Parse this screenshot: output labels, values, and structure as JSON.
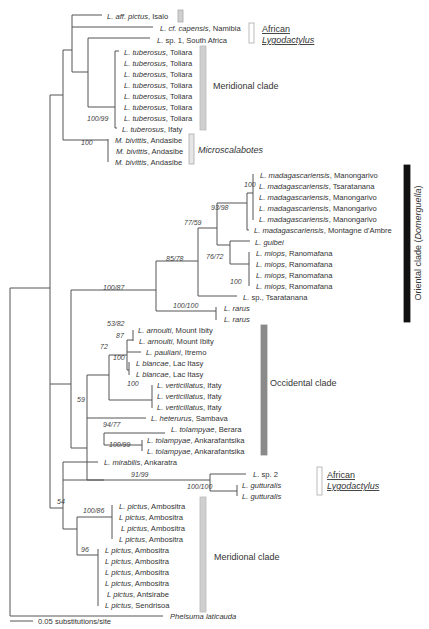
{
  "figure": {
    "type": "phylogenetic-tree",
    "scale_bar": {
      "label": "0.05 substitutions/site",
      "x1": 10,
      "x2": 33,
      "y": 621
    },
    "colors": {
      "line": "#555555",
      "grey_bar": "#d3d3d3",
      "dark_grey_bar": "#8a8a8a",
      "black_bar": "#111111"
    }
  },
  "taxa": [
    {
      "y": 16,
      "x": 104,
      "genus": "L. aff. pictus",
      "loc": ", Isalo"
    },
    {
      "y": 28,
      "x": 157,
      "genus": "L. cf. capensis",
      "loc": ", Namibia"
    },
    {
      "y": 40,
      "x": 154,
      "genus": "L.",
      "loc": " sp. 1, South Africa"
    },
    {
      "y": 52,
      "x": 121,
      "genus": "L. tuberosus",
      "loc": ", Toliara"
    },
    {
      "y": 63,
      "x": 121,
      "genus": "L. tuberosus",
      "loc": ", Toliara"
    },
    {
      "y": 74,
      "x": 121,
      "genus": "L. tuberosus",
      "loc": ", Toliara"
    },
    {
      "y": 85,
      "x": 121,
      "genus": "L. tuberosus",
      "loc": ", Toliara"
    },
    {
      "y": 96,
      "x": 121,
      "genus": "L. tuberosus",
      "loc": ", Toliara"
    },
    {
      "y": 107,
      "x": 121,
      "genus": "L. tuberosus",
      "loc": ", Toliara"
    },
    {
      "y": 118,
      "x": 121,
      "genus": "L. tuberosus",
      "loc": ", Toliara"
    },
    {
      "y": 129,
      "x": 119,
      "genus": "L. tuberosus",
      "loc": ", Ifaty"
    },
    {
      "y": 140,
      "x": 112,
      "genus": "M. bivittis",
      "loc": ", Andasibe"
    },
    {
      "y": 151,
      "x": 113,
      "genus": "M. bivittis",
      "loc": ", Andasibe"
    },
    {
      "y": 162,
      "x": 112,
      "genus": "M. bivittis",
      "loc": ", Andasibe"
    },
    {
      "y": 175,
      "x": 257,
      "genus": "L. madagascariensis",
      "loc": ", Manongarivo"
    },
    {
      "y": 186,
      "x": 256,
      "genus": "L. madagascariensis",
      "loc": ", Tsaratanana"
    },
    {
      "y": 197,
      "x": 256,
      "genus": "L. madagascariensis",
      "loc": ", Manongarivo"
    },
    {
      "y": 208,
      "x": 256,
      "genus": "L. madagascariensis",
      "loc": ", Manongarivo"
    },
    {
      "y": 219,
      "x": 256,
      "genus": "L. madagascariensis",
      "loc": ", Manongarivo"
    },
    {
      "y": 230,
      "x": 251,
      "genus": "L. madagascariensis",
      "loc": ", Montagne d'Ambre"
    },
    {
      "y": 242,
      "x": 252,
      "genus": "L. guibei",
      "loc": ""
    },
    {
      "y": 253,
      "x": 253,
      "genus": "L. miops",
      "loc": ", Ranomafana"
    },
    {
      "y": 264,
      "x": 253,
      "genus": "L. miops",
      "loc": ", Ranomafana"
    },
    {
      "y": 275,
      "x": 253,
      "genus": "L. miops",
      "loc": ", Ranomafana"
    },
    {
      "y": 286,
      "x": 253,
      "genus": "L. miops",
      "loc": ", Ranomafana"
    },
    {
      "y": 297,
      "x": 240,
      "genus": "L.",
      "loc": " sp., Tsaratanana"
    },
    {
      "y": 308,
      "x": 221,
      "genus": "L. rarus",
      "loc": ""
    },
    {
      "y": 319,
      "x": 221,
      "genus": "L. rarus",
      "loc": ""
    },
    {
      "y": 330,
      "x": 135,
      "genus": "L. arnoulti",
      "loc": ", Mount Ibity"
    },
    {
      "y": 341,
      "x": 136,
      "genus": "L. arnoulti",
      "loc": ", Mount Ibity"
    },
    {
      "y": 352,
      "x": 143,
      "genus": "L. pauliani",
      "loc": ", Itremo"
    },
    {
      "y": 363,
      "x": 133,
      "genus": "L blancae",
      "loc": ", Lac Itasy"
    },
    {
      "y": 374,
      "x": 133,
      "genus": "L blancae",
      "loc": ", Lac Itasy"
    },
    {
      "y": 385,
      "x": 154,
      "genus": "L. verticillatus",
      "loc": ", Ifaty"
    },
    {
      "y": 396,
      "x": 154,
      "genus": "L. verticillatus",
      "loc": ", Ifaty"
    },
    {
      "y": 407,
      "x": 154,
      "genus": "L. verticillatus",
      "loc": ", Ifaty"
    },
    {
      "y": 418,
      "x": 148,
      "genus": "L. heterurus",
      "loc": ", Sambava"
    },
    {
      "y": 429,
      "x": 168,
      "genus": "L. tolampyae",
      "loc": ", Berara"
    },
    {
      "y": 440,
      "x": 144,
      "genus": "L. tolampyae",
      "loc": ", Ankarafantsika"
    },
    {
      "y": 451,
      "x": 144,
      "genus": "L. tolampyae",
      "loc": ", Ankarafantsika"
    },
    {
      "y": 462,
      "x": 101,
      "genus": "L. mirabilis",
      "loc": ", Ankaratra"
    },
    {
      "y": 474,
      "x": 250,
      "genus": "L.",
      "loc": " sp. 2"
    },
    {
      "y": 485,
      "x": 239,
      "genus": "L. gutturalis",
      "loc": ""
    },
    {
      "y": 496,
      "x": 239,
      "genus": "L. gutturalis",
      "loc": ""
    },
    {
      "y": 506,
      "x": 116,
      "genus": "L. pictus",
      "loc": ", Ambositra"
    },
    {
      "y": 517,
      "x": 116,
      "genus": "L pictus",
      "loc": ", Ambositra"
    },
    {
      "y": 528,
      "x": 118,
      "genus": "L pictus",
      "loc": ", Ambositra"
    },
    {
      "y": 539,
      "x": 116,
      "genus": "L pictus",
      "loc": ", Ambositra"
    },
    {
      "y": 550,
      "x": 102,
      "genus": "L pictus",
      "loc": ", Ambositra"
    },
    {
      "y": 561,
      "x": 102,
      "genus": "L pictus",
      "loc": ", Ambositra"
    },
    {
      "y": 572,
      "x": 102,
      "genus": "L pictus",
      "loc": ", Ambositra"
    },
    {
      "y": 583,
      "x": 102,
      "genus": "L pictus",
      "loc": ", Ambositra"
    },
    {
      "y": 594,
      "x": 104,
      "genus": "L pictus",
      "loc": ", Antsirabe"
    },
    {
      "y": 605,
      "x": 102,
      "genus": "L pictus",
      "loc": ", Sendrisoa"
    },
    {
      "y": 616,
      "x": 167,
      "genus": "Phelsuma laticauda",
      "loc": "",
      "allItalic": true
    }
  ],
  "branches": [
    "M10,616 H163",
    "M10,288 V616",
    "M10,288 H50",
    "M50,95 V508",
    "M50,95 H63",
    "M63,50 V140",
    "M63,50 H72",
    "M72,15 V72",
    "M72,15 H102",
    "M72,27 H153",
    "M72,72 H88",
    "M88,38 V107",
    "M88,38 H150",
    "M88,107 H115",
    "M115,51 V128",
    "M115,51 H119",
    "M115,128 H117",
    "M63,140 H108",
    "M108,139 V162",
    "M50,384 H71",
    "M71,290 V448",
    "M71,290 H156",
    "M156,261 V311",
    "M156,261 H198",
    "M198,228 V296",
    "M198,228 H217",
    "M217,203 V245",
    "M217,203 H247",
    "M247,193 V230",
    "M247,193 H253",
    "M253,174 V220",
    "M247,230 H249",
    "M217,245 H230",
    "M230,241 V264",
    "M230,241 H250",
    "M230,264 H249",
    "M249,252 V286",
    "M198,296 H237",
    "M156,311 H216",
    "M216,307 V320",
    "M71,448 H87",
    "M87,375 V480",
    "M87,375 H109",
    "M109,355 V400",
    "M109,355 H127",
    "M127,340 V370",
    "M127,340 H133",
    "M133,330 V341",
    "M127,352 H141",
    "M127,370 H129",
    "M129,362 V375",
    "M109,400 H152",
    "M152,385 V408",
    "M87,418 H146",
    "M87,480 H104",
    "M104,433 V445",
    "M104,433 H165",
    "M104,445 H142",
    "M142,440 V451",
    "M50,508 H63",
    "M63,462 V529",
    "M63,462 H98",
    "M63,480 H210",
    "M210,474 V491",
    "M210,474 H246",
    "M210,491 H237",
    "M237,485 V496",
    "M63,529 H77",
    "M77,517 V555",
    "M77,517 H112",
    "M112,505 V539",
    "M77,555 H98",
    "M98,549 V606"
  ],
  "support": [
    {
      "x": 87,
      "y": 121,
      "t": "100/99",
      "italic": true
    },
    {
      "x": 81,
      "y": 145,
      "t": "100",
      "italic": true
    },
    {
      "x": 244,
      "y": 187,
      "t": "100",
      "italic": true
    },
    {
      "x": 211,
      "y": 210,
      "t": "93/98",
      "italic": false
    },
    {
      "x": 184,
      "y": 225,
      "t": "77/59",
      "italic": false
    },
    {
      "x": 206,
      "y": 259,
      "t": "76/72",
      "italic": false
    },
    {
      "x": 166,
      "y": 261,
      "t": "85/78",
      "italic": true
    },
    {
      "x": 103,
      "y": 290,
      "t": "100/87",
      "italic": true
    },
    {
      "x": 230,
      "y": 284,
      "t": "100",
      "italic": true
    },
    {
      "x": 173,
      "y": 308,
      "t": "100/100",
      "italic": true
    },
    {
      "x": 107,
      "y": 326,
      "t": "53/82",
      "italic": false
    },
    {
      "x": 116,
      "y": 338,
      "t": "87",
      "italic": true
    },
    {
      "x": 100,
      "y": 349,
      "t": "72",
      "italic": true
    },
    {
      "x": 113,
      "y": 360,
      "t": "100",
      "italic": true
    },
    {
      "x": 127,
      "y": 386,
      "t": "100",
      "italic": true
    },
    {
      "x": 77,
      "y": 402,
      "t": "59",
      "italic": true
    },
    {
      "x": 103,
      "y": 427,
      "t": "94/77",
      "italic": true
    },
    {
      "x": 109,
      "y": 447,
      "t": "100/99",
      "italic": true
    },
    {
      "x": 131,
      "y": 477,
      "t": "91/99",
      "italic": true
    },
    {
      "x": 187,
      "y": 489,
      "t": "100/100",
      "italic": true
    },
    {
      "x": 57,
      "y": 504,
      "t": "54",
      "italic": false
    },
    {
      "x": 83,
      "y": 513,
      "t": "100/86",
      "italic": true
    },
    {
      "x": 81,
      "y": 552,
      "t": "96",
      "italic": true
    }
  ],
  "clades": [
    {
      "kind": "bar",
      "x": 178,
      "y": 10,
      "w": 5,
      "h": 12,
      "fill": "#d0d0d0",
      "stroke": "#aaaaaa",
      "label": "",
      "lx": 0,
      "ly": 0
    },
    {
      "kind": "bar",
      "x": 249,
      "y": 23,
      "w": 5,
      "h": 20,
      "fill": "#ffffff",
      "stroke": "#aaaaaa",
      "label": "African",
      "label2": "Lygodactylus",
      "lx": 262,
      "ly": 32,
      "underline": true
    },
    {
      "kind": "bar",
      "x": 200,
      "y": 46,
      "w": 6,
      "h": 84,
      "fill": "#cfcfcf",
      "stroke": "#bbbbbb",
      "label": "Meridional clade",
      "lx": 213,
      "ly": 89
    },
    {
      "kind": "bar",
      "x": 189,
      "y": 134,
      "w": 5,
      "h": 30,
      "fill": "#e6e6e6",
      "stroke": "#aaaaaa",
      "label": "Microscalabotes",
      "lx": 198,
      "ly": 153,
      "italicLabel": true
    },
    {
      "kind": "bar",
      "x": 404,
      "y": 165,
      "w": 6,
      "h": 157,
      "fill": "#111111",
      "stroke": "#111111",
      "label": "Oriental clade (Domerguella)",
      "lx": 421,
      "ly": 243,
      "vertical": true
    },
    {
      "kind": "bar",
      "x": 261,
      "y": 325,
      "w": 6,
      "h": 130,
      "fill": "#8a8a8a",
      "stroke": "#8a8a8a",
      "label": "Occidental clade",
      "lx": 270,
      "ly": 386
    },
    {
      "kind": "bar",
      "x": 317,
      "y": 467,
      "w": 5,
      "h": 28,
      "fill": "#ffffff",
      "stroke": "#aaaaaa",
      "label": "African",
      "label2": "Lygodactylus",
      "lx": 327,
      "ly": 478,
      "underline": true
    },
    {
      "kind": "bar",
      "x": 200,
      "y": 497,
      "w": 6,
      "h": 115,
      "fill": "#cfcfcf",
      "stroke": "#bbbbbb",
      "label": "Meridional clade",
      "lx": 214,
      "ly": 560
    }
  ]
}
